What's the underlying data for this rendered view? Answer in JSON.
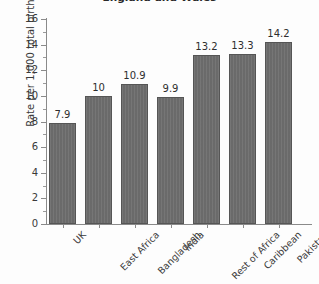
{
  "chart_data": {
    "type": "bar",
    "title": "England and Wales",
    "xlabel": "",
    "ylabel": "Rate per 1,000 total births",
    "categories": [
      "UK",
      "East Africa",
      "Bangladesh",
      "India",
      "Rest of Africa",
      "Caribbean",
      "Pakistan"
    ],
    "values": [
      7.9,
      10,
      10.9,
      9.9,
      13.2,
      13.3,
      14.2
    ],
    "value_labels": [
      "7.9",
      "10",
      "10.9",
      "9.9",
      "13.2",
      "13.3",
      "14.2"
    ],
    "ylim": [
      0,
      16
    ],
    "ytick_labels": [
      "0",
      "2",
      "4",
      "6",
      "8",
      "10",
      "12",
      "14",
      "16"
    ],
    "ytick_values": [
      0,
      2,
      4,
      6,
      8,
      10,
      12,
      14,
      16
    ],
    "minor_ticks": true,
    "grid": false,
    "legend": null,
    "bar_color": "#6e6e6e",
    "bar_edge_color": "#555555",
    "axis_color": "#8a8a8a",
    "text_color": "#2e2e2e",
    "background": "#fdfdfd"
  }
}
